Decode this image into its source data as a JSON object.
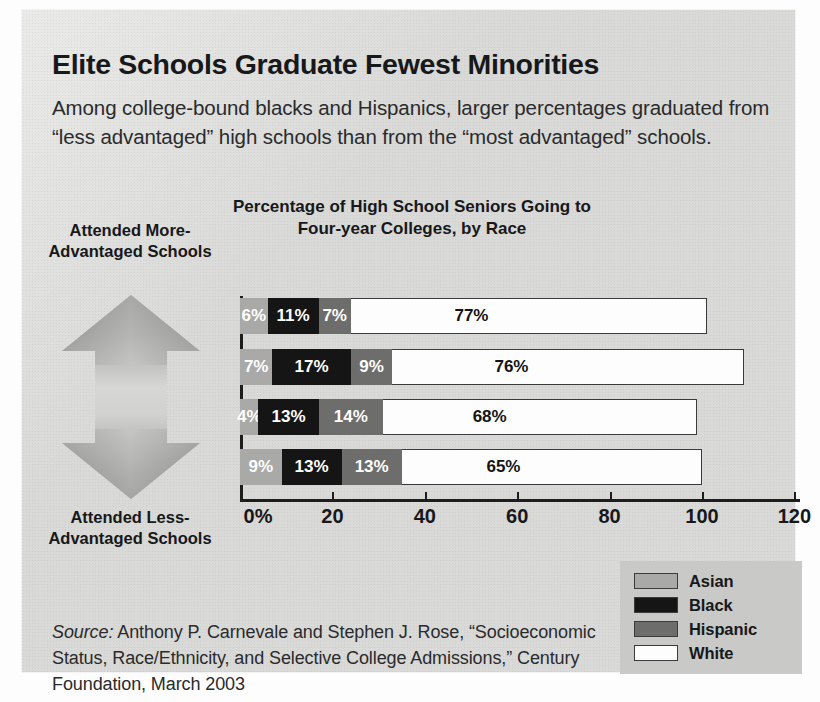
{
  "headline": "Elite Schools Graduate Fewest Minorities",
  "deck": "Among college-bound blacks and Hispanics, larger percentages graduated from “less advantaged” high schools than from the “most advantaged” schools.",
  "chart_title_line1": "Percentage of High School Seniors Going to",
  "chart_title_line2": "Four-year Colleges, by Race",
  "axis_annotation": {
    "top": "Attended More-Advantaged Schools",
    "bottom": "Attended Less-Advantaged Schools",
    "arrow": "double-headed-vertical-arrow"
  },
  "legend": {
    "items": [
      {
        "label": "Asian",
        "color": "#a9a9a7"
      },
      {
        "label": "Black",
        "color": "#151515"
      },
      {
        "label": "Hispanic",
        "color": "#6d6d6b"
      },
      {
        "label": "White",
        "color": "#fdfdfd"
      }
    ]
  },
  "source": {
    "prefix": "Source:",
    "text": " Anthony P. Carnevale and Stephen J. Rose, “Socioeconomic Status, Race/Ethnicity, and Selective College Admissions,” Century Foundation, March 2003"
  },
  "chart_data": {
    "type": "bar",
    "orientation": "horizontal",
    "stacked": true,
    "title": "Percentage of High School Seniors Going to Four-year Colleges, by Race",
    "xlabel": "",
    "ylabel": "",
    "xlim": [
      0,
      120
    ],
    "xticks": [
      0,
      20,
      40,
      60,
      80,
      100,
      120
    ],
    "xticklabels": [
      "0%",
      "20",
      "40",
      "60",
      "80",
      "100",
      "120"
    ],
    "grid": false,
    "legend_position": "bottom-right",
    "categories": [
      "Attended more-advantaged schools (top)",
      "Second",
      "Third",
      "Attended less-advantaged schools (bottom)"
    ],
    "series": [
      {
        "name": "Asian",
        "color": "#a9a9a7",
        "values": [
          6,
          7,
          4,
          9
        ]
      },
      {
        "name": "Black",
        "color": "#151515",
        "values": [
          11,
          17,
          13,
          13
        ]
      },
      {
        "name": "Hispanic",
        "color": "#6d6d6b",
        "values": [
          7,
          9,
          14,
          13
        ]
      },
      {
        "name": "White",
        "color": "#fdfdfd",
        "values": [
          77,
          76,
          68,
          65
        ]
      }
    ],
    "bars": [
      {
        "index": 0,
        "segments": [
          {
            "name": "Asian",
            "value": 6,
            "label": "6%"
          },
          {
            "name": "Black",
            "value": 11,
            "label": "11%"
          },
          {
            "name": "Hispanic",
            "value": 7,
            "label": "7%"
          },
          {
            "name": "White",
            "value": 77,
            "label": "77%"
          }
        ]
      },
      {
        "index": 1,
        "segments": [
          {
            "name": "Asian",
            "value": 7,
            "label": "7%"
          },
          {
            "name": "Black",
            "value": 17,
            "label": "17%"
          },
          {
            "name": "Hispanic",
            "value": 9,
            "label": "9%"
          },
          {
            "name": "White",
            "value": 76,
            "label": "76%"
          }
        ]
      },
      {
        "index": 2,
        "segments": [
          {
            "name": "Asian",
            "value": 4,
            "label": "4%"
          },
          {
            "name": "Black",
            "value": 13,
            "label": "13%"
          },
          {
            "name": "Hispanic",
            "value": 14,
            "label": "14%"
          },
          {
            "name": "White",
            "value": 68,
            "label": "68%"
          }
        ]
      },
      {
        "index": 3,
        "segments": [
          {
            "name": "Asian",
            "value": 9,
            "label": "9%"
          },
          {
            "name": "Black",
            "value": 13,
            "label": "13%"
          },
          {
            "name": "Hispanic",
            "value": 13,
            "label": "13%"
          },
          {
            "name": "White",
            "value": 65,
            "label": "65%"
          }
        ]
      }
    ]
  }
}
